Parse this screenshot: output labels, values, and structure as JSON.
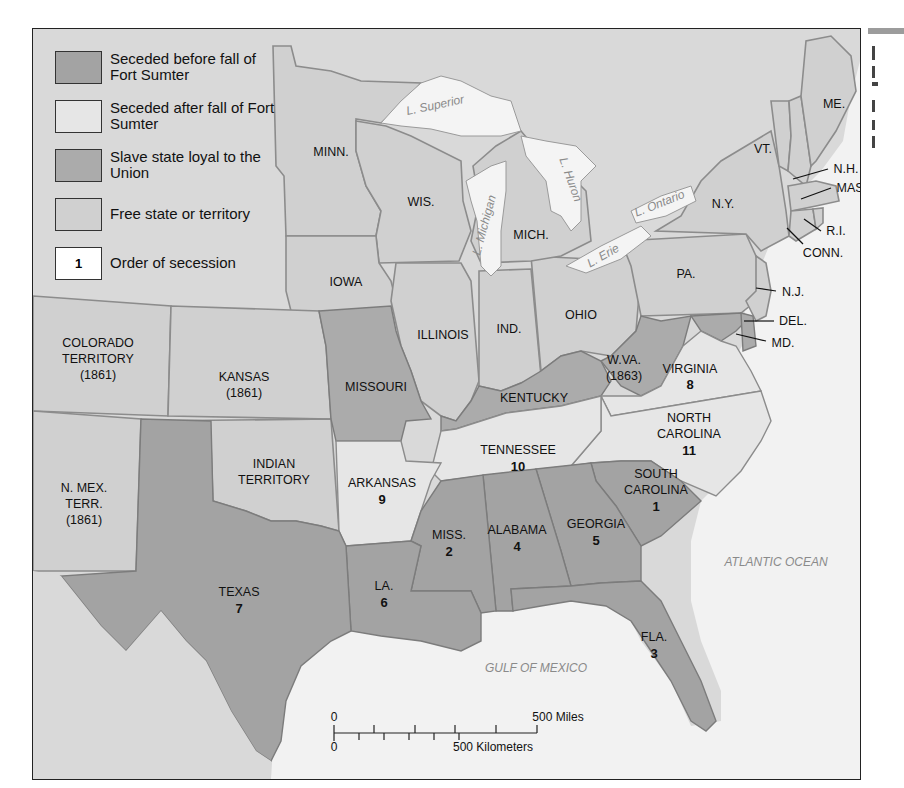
{
  "legend": {
    "items": [
      {
        "key": "early",
        "label": "Seceded before fall of Fort Sumter",
        "color": "#a3a3a3"
      },
      {
        "key": "late",
        "label": "Seceded after fall of Fort Sumter",
        "color": "#e6e6e6"
      },
      {
        "key": "loyal",
        "label": "Slave state loyal to the Union",
        "color": "#ababab"
      },
      {
        "key": "free",
        "label": "Free state or territory",
        "color": "#d0d0d0"
      },
      {
        "key": "order",
        "label": "Order of secession",
        "swatch_text": "1",
        "color": "#ffffff"
      }
    ]
  },
  "states": {
    "minn": "MINN.",
    "wis": "WIS.",
    "mich": "MICH.",
    "iowa": "IOWA",
    "illinois": "ILLINOIS",
    "ind": "IND.",
    "ohio": "OHIO",
    "pa": "PA.",
    "ny": "N.Y.",
    "vt": "VT.",
    "me": "ME.",
    "nh": "N.H.",
    "mass": "MASS.",
    "ri": "R.I.",
    "conn": "CONN.",
    "nj": "N.J.",
    "del": "DEL.",
    "md": "MD.",
    "colorado": [
      "COLORADO",
      "TERRITORY",
      "(1861)"
    ],
    "kansas": [
      "KANSAS",
      "(1861)"
    ],
    "missouri": "MISSOURI",
    "kentucky": "KENTUCKY",
    "wva": [
      "W.VA.",
      "(1863)"
    ],
    "virginia": {
      "name": "VIRGINIA",
      "order": "8"
    },
    "nmex": [
      "N. MEX.",
      "TERR.",
      "(1861)"
    ],
    "indian": [
      "INDIAN",
      "TERRITORY"
    ],
    "arkansas": {
      "name": "ARKANSAS",
      "order": "9"
    },
    "tennessee": {
      "name": "TENNESSEE",
      "order": "10"
    },
    "ncarolina": {
      "name1": "NORTH",
      "name2": "CAROLINA",
      "order": "11"
    },
    "scarolina": {
      "name1": "SOUTH",
      "name2": "CAROLINA",
      "order": "1"
    },
    "miss": {
      "name": "MISS.",
      "order": "2"
    },
    "alabama": {
      "name": "ALABAMA",
      "order": "4"
    },
    "georgia": {
      "name": "GEORGIA",
      "order": "5"
    },
    "texas": {
      "name": "TEXAS",
      "order": "7"
    },
    "la": {
      "name": "LA.",
      "order": "6"
    },
    "fla": {
      "name": "FLA.",
      "order": "3"
    }
  },
  "water": {
    "superior": "L. Superior",
    "michigan": "L. Michigan",
    "huron": "L. Huron",
    "erie": "L. Erie",
    "ontario": "L. Ontario",
    "atlantic": "ATLANTIC OCEAN",
    "gulf": "GULF OF MEXICO"
  },
  "scale": {
    "miles_zero": "0",
    "miles_label": "500 Miles",
    "km_zero": "0",
    "km_label": "500 Kilometers"
  }
}
